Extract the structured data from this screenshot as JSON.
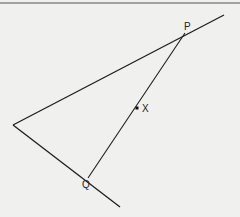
{
  "figure": {
    "colors": {
      "background": "#f0f0ee",
      "line": "#1e1e1e",
      "border": "#555555"
    },
    "points": {
      "vertex": {
        "x": 13,
        "y": 125
      },
      "P": {
        "x": 185,
        "y": 33,
        "label": "P"
      },
      "Q": {
        "x": 88,
        "y": 178,
        "label": "Q"
      },
      "X": {
        "x": 137,
        "y": 108,
        "label": "X"
      }
    },
    "rays": [
      {
        "name": "upper-ray",
        "from": {
          "x": 13,
          "y": 125
        },
        "to": {
          "x": 224,
          "y": 15
        }
      },
      {
        "name": "lower-ray",
        "from": {
          "x": 13,
          "y": 125
        },
        "to": {
          "x": 120,
          "y": 207
        }
      }
    ],
    "labels": {
      "P": "P",
      "X": "X",
      "Q": "Q"
    }
  }
}
